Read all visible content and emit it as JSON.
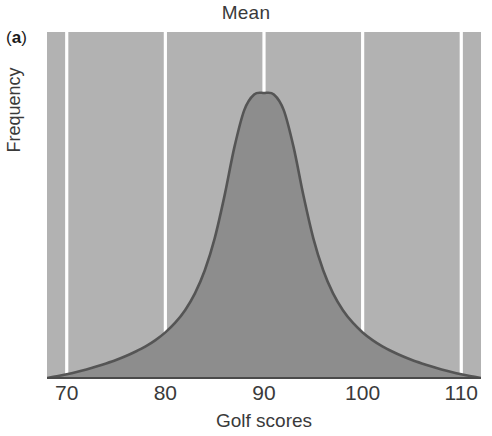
{
  "figure": {
    "panel_letter_open": "(",
    "panel_letter": "a",
    "panel_letter_close": ")",
    "width": 492,
    "height": 436
  },
  "colors": {
    "page_background": "#ffffff",
    "plot_background": "#b2b2b2",
    "distribution_fill": "#8d8d8d",
    "curve_stroke": "#555555",
    "gridline": "#ffffff",
    "axis_line": "#4a4a4a",
    "text": "#3a3a3a"
  },
  "chart_data": {
    "type": "area",
    "title": "Mean",
    "xlabel": "Golf scores",
    "ylabel": "Frequency",
    "xlim": [
      68,
      112
    ],
    "ylim": [
      0,
      1
    ],
    "grid": true,
    "grid_orientation": "vertical",
    "legend": null,
    "legend_position": "none",
    "xticks": [
      70,
      80,
      90,
      100,
      110
    ],
    "xticklabels": [
      "70",
      "80",
      "90",
      "100",
      "110"
    ],
    "yticks": [],
    "yticklabels": [],
    "annotations": [
      {
        "label": "Mean",
        "x": 90,
        "placement": "top-center",
        "description": "Title marks the mean of the distribution at a golf score of 90"
      }
    ],
    "distribution": {
      "shape": "leptokurtic",
      "mean": 90,
      "mode": 90,
      "median": 90,
      "symmetric": true,
      "description": "Unimodal symmetric heavy-tailed distribution of golf scores peaking sharply at the mean of 90"
    },
    "series": [
      {
        "name": "Frequency of golf scores",
        "x": [
          68,
          69,
          70,
          71,
          72,
          73,
          74,
          75,
          76,
          77,
          78,
          79,
          80,
          81,
          82,
          83,
          84,
          85,
          86,
          87,
          88,
          89,
          90,
          91,
          92,
          93,
          94,
          95,
          96,
          97,
          98,
          99,
          100,
          101,
          102,
          103,
          104,
          105,
          106,
          107,
          108,
          109,
          110,
          111,
          112
        ],
        "y": [
          0.0,
          0.006,
          0.013,
          0.021,
          0.03,
          0.04,
          0.051,
          0.063,
          0.077,
          0.093,
          0.111,
          0.133,
          0.16,
          0.194,
          0.238,
          0.297,
          0.378,
          0.49,
          0.64,
          0.81,
          0.94,
          0.995,
          1.0,
          0.995,
          0.94,
          0.81,
          0.64,
          0.49,
          0.378,
          0.297,
          0.238,
          0.194,
          0.16,
          0.133,
          0.111,
          0.093,
          0.077,
          0.063,
          0.051,
          0.04,
          0.03,
          0.021,
          0.013,
          0.006,
          0.0
        ]
      }
    ]
  }
}
